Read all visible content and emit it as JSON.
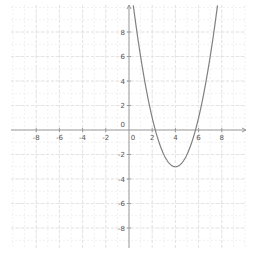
{
  "chart_data": {
    "type": "line",
    "title": "",
    "xlabel": "",
    "ylabel": "",
    "function": "y = (x - 4)^2 - 3",
    "series": [
      {
        "name": "f(x)",
        "color": "#777777",
        "x": [
          0.37,
          1,
          2,
          2.27,
          3,
          4,
          5,
          5.73,
          6,
          7,
          7.63
        ],
        "y": [
          10.2,
          6,
          1,
          0,
          -2,
          -3,
          -2,
          0,
          1,
          6,
          10.2
        ]
      }
    ],
    "vertex": {
      "x": 4,
      "y": -3
    },
    "x_ticks": [
      -8,
      -6,
      -4,
      -2,
      0,
      2,
      4,
      6,
      8
    ],
    "y_ticks": [
      8,
      6,
      4,
      2,
      0,
      -2,
      -4,
      -6,
      -8
    ],
    "x_tick_labels": [
      "-8",
      "-6",
      "-4",
      "-2",
      "0",
      "2",
      "4",
      "6",
      "8"
    ],
    "y_tick_labels": [
      "8",
      "6",
      "4",
      "2",
      "0",
      "-2",
      "-4",
      "-6",
      "-8"
    ],
    "xlim": [
      -10.1,
      10
    ],
    "ylim": [
      -9.8,
      10.2
    ],
    "grid": true,
    "legend": null
  },
  "colors": {
    "axis": "#999999",
    "grid": "#e4e4e4",
    "curve": "#808080",
    "label": "#555555"
  }
}
